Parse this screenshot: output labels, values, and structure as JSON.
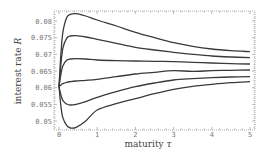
{
  "chart_data": {
    "type": "line",
    "title": "",
    "xlabel": "maturity τ",
    "ylabel_text": "interest rate ",
    "ylabel_var": "R",
    "xlabel_text": "maturity ",
    "xlabel_var": "τ",
    "xlim": [
      0,
      5
    ],
    "ylim": [
      0.0473,
      0.0833
    ],
    "grid": false,
    "legend": "none",
    "xticks": [
      "0",
      "1",
      "2",
      "3",
      "4",
      "5"
    ],
    "yticks": [
      "0.05",
      "0.055",
      "0.06",
      "0.065",
      "0.07",
      "0.075",
      "0.08"
    ],
    "x": [
      0,
      0.05,
      0.1,
      0.2,
      0.3,
      0.45,
      0.7,
      1,
      1.5,
      2,
      2.5,
      3,
      3.5,
      4,
      4.5,
      5
    ],
    "series": [
      {
        "name": "curve-1",
        "values": [
          0.0603,
          0.07,
          0.0765,
          0.081,
          0.082,
          0.0822,
          0.0815,
          0.0803,
          0.0785,
          0.0766,
          0.075,
          0.0735,
          0.0724,
          0.0716,
          0.0711,
          0.0708
        ]
      },
      {
        "name": "curve-2",
        "values": [
          0.0603,
          0.067,
          0.0718,
          0.0748,
          0.0755,
          0.0756,
          0.0752,
          0.0745,
          0.0733,
          0.0721,
          0.0713,
          0.0706,
          0.07,
          0.0695,
          0.0692,
          0.069
        ]
      },
      {
        "name": "curve-3",
        "values": [
          0.0603,
          0.064,
          0.0665,
          0.0682,
          0.0686,
          0.0687,
          0.0686,
          0.0683,
          0.0681,
          0.068,
          0.0679,
          0.0678,
          0.0676,
          0.0674,
          0.0672,
          0.0671
        ]
      },
      {
        "name": "curve-4",
        "values": [
          0.0603,
          0.0608,
          0.0612,
          0.0616,
          0.0618,
          0.062,
          0.0622,
          0.0625,
          0.0633,
          0.0641,
          0.0646,
          0.0651,
          0.0649,
          0.0651,
          0.0652,
          0.0653
        ]
      },
      {
        "name": "curve-5",
        "values": [
          0.0603,
          0.0578,
          0.0562,
          0.0551,
          0.0548,
          0.055,
          0.0558,
          0.0571,
          0.0588,
          0.0603,
          0.0614,
          0.0623,
          0.0627,
          0.063,
          0.0632,
          0.0633
        ]
      },
      {
        "name": "curve-6",
        "values": [
          0.0603,
          0.0545,
          0.051,
          0.0487,
          0.0479,
          0.0481,
          0.05,
          0.0533,
          0.0552,
          0.0567,
          0.0582,
          0.0595,
          0.0604,
          0.061,
          0.0615,
          0.0618
        ]
      }
    ]
  },
  "layout": {
    "frame": {
      "left": 54,
      "top": 11,
      "right": 255,
      "bottom": 130
    },
    "x0_px": 59,
    "x1_px": 250,
    "y_hi_val": 0.08,
    "y_hi_px": 21,
    "y_lo_val": 0.05,
    "y_lo_px": 121
  }
}
